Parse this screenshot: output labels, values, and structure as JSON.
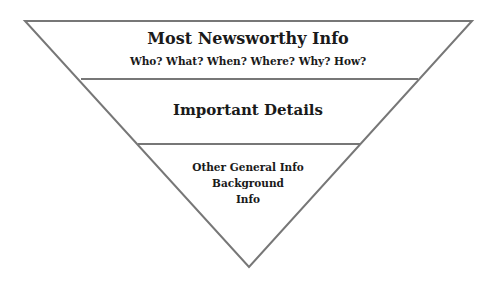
{
  "diagram": {
    "line_color": "#777777",
    "tiers": [
      {
        "heading": "Most Newsworthy Info",
        "subheading": "Who? What? When? Where? Why? How?"
      },
      {
        "heading": "Important Details"
      },
      {
        "lines": [
          "Other General Info",
          "Background",
          "Info"
        ]
      }
    ]
  }
}
